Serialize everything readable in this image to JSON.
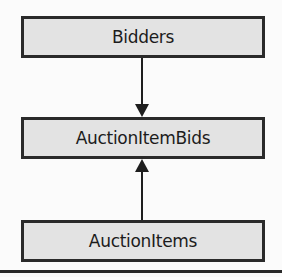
{
  "diagram": {
    "nodes": [
      {
        "id": "bidders",
        "label": "Bidders"
      },
      {
        "id": "auctionitembids",
        "label": "AuctionItemBids"
      },
      {
        "id": "auctionitems",
        "label": "AuctionItems"
      }
    ],
    "edges": [
      {
        "from": "bidders",
        "to": "auctionitembids",
        "direction": "down"
      },
      {
        "from": "auctionitems",
        "to": "auctionitembids",
        "direction": "up"
      }
    ],
    "colors": {
      "box_fill": "#e3e3e3",
      "border": "#2a2a2a",
      "background": "#fbfbfb"
    }
  }
}
